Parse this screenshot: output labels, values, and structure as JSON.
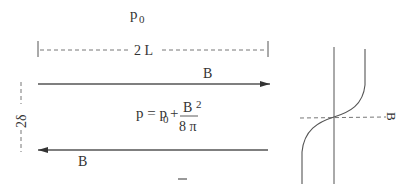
{
  "diagram": {
    "title_pressure": {
      "base": "p",
      "sub": "0"
    },
    "length_label": "2 L",
    "thickness_label": "2δ",
    "top_field_label": "B",
    "bottom_field_label": "B",
    "equation": {
      "lhs": "p = p",
      "lhs_sub": "0",
      "plus": "+",
      "numerator": "B",
      "exponent": "2",
      "denominator": "8 π"
    },
    "minus_mark": "–",
    "profile_axis_label": "B",
    "colors": {
      "line": "#555555",
      "text": "#333333",
      "background": "#ffffff"
    }
  }
}
